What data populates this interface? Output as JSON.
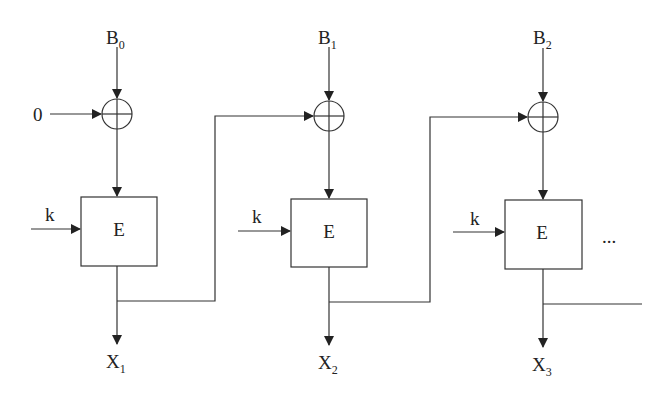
{
  "diagram": {
    "type": "cipher-block-chaining-encryption",
    "initial_input": "0",
    "key_label": "k",
    "encrypt_label": "E",
    "continuation": "...",
    "stages": [
      {
        "input_base": "B",
        "input_sub": "0",
        "output_base": "X",
        "output_sub": "1"
      },
      {
        "input_base": "B",
        "input_sub": "1",
        "output_base": "X",
        "output_sub": "2"
      },
      {
        "input_base": "B",
        "input_sub": "2",
        "output_base": "X",
        "output_sub": "3"
      }
    ]
  }
}
